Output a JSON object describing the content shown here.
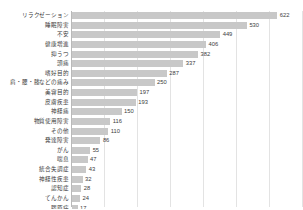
{
  "chart_data": {
    "type": "bar",
    "orientation": "horizontal",
    "title": "",
    "xlabel": "",
    "ylabel": "",
    "xlim": [
      0,
      700
    ],
    "grid": true,
    "gridline_interval": 100,
    "legend": false,
    "bar_color": "#c8c8c8",
    "categories": [
      "リラクゼーション",
      "睡眠障害",
      "不安",
      "健康増進",
      "抑うつ",
      "頭痛",
      "嗜好目的",
      "肩・腰・膝などの痛み",
      "美容目的",
      "皮膚疾患",
      "神経痛",
      "物質使用障害",
      "その他",
      "発達障害",
      "がん",
      "喘息",
      "統合失調症",
      "神経性疾患",
      "認知症",
      "てんかん",
      "膠原病"
    ],
    "values": [
      622,
      530,
      449,
      406,
      382,
      337,
      287,
      250,
      197,
      193,
      150,
      116,
      110,
      86,
      55,
      47,
      43,
      32,
      28,
      24,
      17
    ]
  }
}
